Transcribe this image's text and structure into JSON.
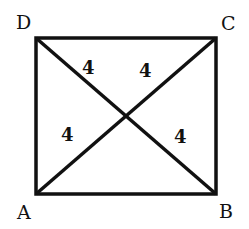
{
  "diagram": {
    "type": "geometry",
    "shape": "rectangle with diagonals",
    "vertices": {
      "A": {
        "label": "A",
        "x": 36,
        "y": 194
      },
      "B": {
        "label": "B",
        "x": 216,
        "y": 194
      },
      "C": {
        "label": "C",
        "x": 216,
        "y": 38
      },
      "D": {
        "label": "D",
        "x": 36,
        "y": 38
      }
    },
    "intersection": {
      "x": 126,
      "y": 116
    },
    "segment_labels": {
      "DO": "4",
      "CO": "4",
      "AO": "4",
      "BO": "4"
    },
    "stroke_color": "#111111"
  }
}
